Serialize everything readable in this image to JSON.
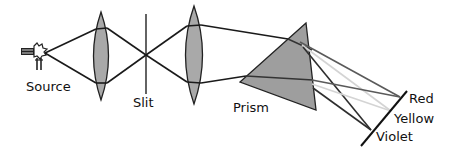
{
  "diagram": {
    "type": "optical spectroscope schematic",
    "labels": {
      "source": "Source",
      "slit": "Slit",
      "prism": "Prism",
      "red": "Red",
      "yellow": "Yellow",
      "violet": "Violet"
    },
    "components": [
      {
        "name": "light-source",
        "label": "Source"
      },
      {
        "name": "collimator-lens-1"
      },
      {
        "name": "slit",
        "label": "Slit"
      },
      {
        "name": "lens-2"
      },
      {
        "name": "prism",
        "label": "Prism"
      },
      {
        "name": "screen"
      }
    ],
    "spectrum_order": [
      "Red",
      "Yellow",
      "Violet"
    ],
    "colors": {
      "lens_fill": "#a9a9a9",
      "prism_fill": "#9e9e9e",
      "ray_dark": "#1a1a1a",
      "ray_red": "#555555",
      "ray_yellow": "#d8d8d8",
      "ray_violet": "#333333"
    }
  }
}
